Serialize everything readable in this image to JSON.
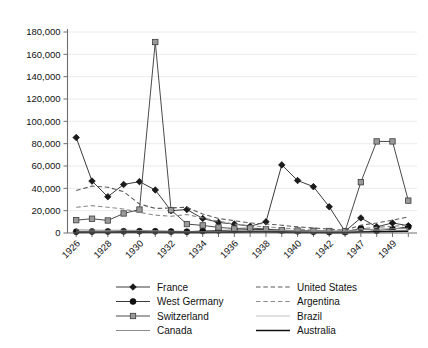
{
  "chart_data": {
    "type": "line",
    "title": "",
    "subtitle": "",
    "xlabel": "",
    "ylabel": "",
    "ylim": [
      0,
      180000
    ],
    "ytick_labels": [
      "0",
      "20,000",
      "40,000",
      "60,000",
      "80,000",
      "100,000",
      "120,000",
      "140,000",
      "160,000",
      "180,000"
    ],
    "ytick_values": [
      0,
      20000,
      40000,
      60000,
      80000,
      100000,
      120000,
      140000,
      160000,
      180000
    ],
    "grid": true,
    "grid_axis": "y",
    "legend_position": "bottom",
    "x": [
      1926,
      1927,
      1928,
      1929,
      1930,
      1931,
      1932,
      1933,
      1934,
      1935,
      1936,
      1937,
      1938,
      1939,
      1940,
      1941,
      1942,
      1946,
      1947,
      1948,
      1949,
      1950
    ],
    "xtick_labels": [
      "1926",
      "",
      "1928",
      "",
      "1930",
      "",
      "1932",
      "",
      "1934",
      "",
      "1936",
      "",
      "1938",
      "",
      "1940",
      "",
      "1942",
      "",
      "1947",
      "",
      "1949",
      ""
    ],
    "xtick_labeled": [
      "1926",
      "1928",
      "1930",
      "1932",
      "1934",
      "1936",
      "1938",
      "1940",
      "1942",
      "1947",
      "1949"
    ],
    "series": [
      {
        "name": "France",
        "marker": "diamond",
        "marker_color": "#1b1b1b",
        "line_color": "#3a3a3a",
        "line_style": "solid",
        "line_width": 1,
        "values": [
          85500,
          46500,
          32500,
          43500,
          46000,
          38500,
          20000,
          21000,
          13000,
          9500,
          8000,
          6000,
          10000,
          61000,
          47000,
          41500,
          23500,
          1500,
          13500,
          5500,
          9000,
          6500
        ]
      },
      {
        "name": "West Germany",
        "marker": "circle",
        "marker_color": "#111111",
        "line_color": "#3a3a3a",
        "line_style": "solid",
        "line_width": 1,
        "values": [
          1200,
          1300,
          1400,
          1500,
          1600,
          1500,
          1300,
          1200,
          1800,
          2200,
          2600,
          3000,
          3200,
          2200,
          1600,
          1200,
          900,
          800,
          4200,
          2000,
          3500,
          5500
        ]
      },
      {
        "name": "Switzerland",
        "marker": "square",
        "marker_color": "#9a9a9a",
        "line_color": "#4a4a4a",
        "line_style": "solid",
        "line_width": 1,
        "values": [
          11500,
          12800,
          11200,
          17500,
          21000,
          171000,
          20500,
          8000,
          6800,
          5000,
          4000,
          4500,
          3500,
          2500,
          2200,
          2000,
          1800,
          1500,
          45500,
          82000,
          82000,
          29000
        ]
      },
      {
        "name": "Canada",
        "marker": "none",
        "marker_color": "#8c8c8c",
        "line_color": "#8c8c8c",
        "line_style": "solid",
        "line_width": 1,
        "values": [
          2800,
          2600,
          2400,
          2500,
          2300,
          2000,
          1700,
          1400,
          1300,
          1500,
          1700,
          2000,
          2200,
          2400,
          2000,
          1600,
          1200,
          1000,
          3000,
          3400,
          3800,
          4200
        ]
      },
      {
        "name": "United States",
        "marker": "none",
        "marker_color": "#6a6a6a",
        "line_color": "#5a5a5a",
        "line_style": "dashed",
        "line_width": 1.1,
        "values": [
          38000,
          42000,
          41000,
          37000,
          26000,
          22000,
          22500,
          23000,
          17000,
          13000,
          11000,
          9000,
          8000,
          7000,
          5500,
          4500,
          3500,
          2500,
          7000,
          9000,
          11500,
          14500
        ]
      },
      {
        "name": "Argentina",
        "marker": "none",
        "marker_color": "#9e9e9e",
        "line_color": "#8a8a8a",
        "line_style": "dashed",
        "line_width": 1.1,
        "values": [
          23000,
          24500,
          23000,
          21500,
          18500,
          16000,
          15000,
          16500,
          13500,
          10500,
          8000,
          6500,
          5500,
          4500,
          3500,
          2500,
          2000,
          1500,
          4000,
          5000,
          6000,
          7000
        ]
      },
      {
        "name": "Brazil",
        "marker": "none",
        "marker_color": "#c2c2c2",
        "line_color": "#c2c2c2",
        "line_style": "solid",
        "line_width": 1.2,
        "values": [
          1000,
          1100,
          1200,
          1300,
          1200,
          1000,
          900,
          800,
          900,
          1000,
          1100,
          1200,
          1300,
          1200,
          1000,
          800,
          600,
          500,
          1400,
          1800,
          2200,
          2600
        ]
      },
      {
        "name": "Australia",
        "marker": "none",
        "marker_color": "#111111",
        "line_color": "#111111",
        "line_style": "solid",
        "line_width": 1.6,
        "values": [
          600,
          650,
          700,
          750,
          800,
          700,
          600,
          550,
          600,
          700,
          800,
          900,
          950,
          800,
          600,
          450,
          350,
          300,
          900,
          1100,
          1300,
          1500
        ]
      }
    ]
  },
  "legend": {
    "left_column": [
      {
        "label": "France",
        "key": "France"
      },
      {
        "label": "West Germany",
        "key": "West Germany"
      },
      {
        "label": "Switzerland",
        "key": "Switzerland"
      },
      {
        "label": "Canada",
        "key": "Canada"
      }
    ],
    "right_column": [
      {
        "label": "United States",
        "key": "United States"
      },
      {
        "label": "Argentina",
        "key": "Argentina"
      },
      {
        "label": "Brazil",
        "key": "Brazil"
      },
      {
        "label": "Australia",
        "key": "Australia"
      }
    ]
  }
}
